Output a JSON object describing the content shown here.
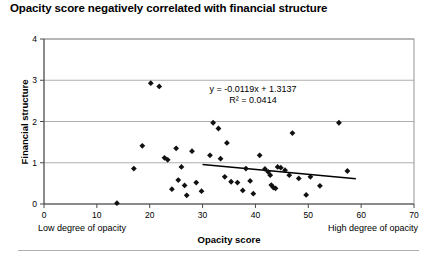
{
  "chart_data": {
    "type": "scatter",
    "title": "Opacity score negatively correlated with financial structure",
    "xlabel": "Opacity score",
    "ylabel": "Financial structure",
    "xlim": [
      0,
      70
    ],
    "ylim": [
      0,
      4
    ],
    "xticks": [
      0,
      10,
      20,
      30,
      40,
      50,
      60,
      70
    ],
    "yticks": [
      0,
      1,
      2,
      3,
      4
    ],
    "grid": "horizontal",
    "legend": "none",
    "annotations": {
      "equation": "y = -0.0119x + 1.3137",
      "r_squared": "R² = 0.0414",
      "x_axis_left_note": "Low degree of opacity",
      "x_axis_right_note": "High degree of opacity"
    },
    "trendline": {
      "slope": -0.0119,
      "intercept": 1.3137,
      "r2": 0.0414,
      "x_start": 30,
      "x_end": 59
    },
    "points": [
      [
        13.8,
        0.02
      ],
      [
        17.0,
        0.86
      ],
      [
        18.6,
        1.41
      ],
      [
        20.2,
        2.93
      ],
      [
        21.8,
        2.85
      ],
      [
        22.8,
        1.12
      ],
      [
        23.4,
        1.07
      ],
      [
        24.2,
        0.36
      ],
      [
        25.0,
        1.35
      ],
      [
        25.4,
        0.58
      ],
      [
        26.0,
        0.9
      ],
      [
        26.6,
        0.45
      ],
      [
        27.0,
        0.21
      ],
      [
        28.0,
        1.28
      ],
      [
        28.8,
        0.52
      ],
      [
        29.8,
        0.31
      ],
      [
        31.4,
        1.18
      ],
      [
        32.0,
        1.97
      ],
      [
        33.0,
        1.83
      ],
      [
        33.4,
        1.1
      ],
      [
        34.2,
        0.66
      ],
      [
        34.6,
        1.48
      ],
      [
        35.4,
        0.54
      ],
      [
        36.6,
        0.52
      ],
      [
        37.6,
        0.33
      ],
      [
        38.2,
        0.86
      ],
      [
        39.0,
        0.56
      ],
      [
        39.6,
        0.25
      ],
      [
        40.8,
        1.18
      ],
      [
        41.8,
        0.85
      ],
      [
        42.4,
        0.78
      ],
      [
        42.8,
        0.7
      ],
      [
        43.0,
        0.46
      ],
      [
        43.4,
        0.4
      ],
      [
        43.8,
        0.38
      ],
      [
        44.2,
        0.9
      ],
      [
        44.8,
        0.88
      ],
      [
        45.6,
        0.82
      ],
      [
        46.4,
        0.7
      ],
      [
        47.0,
        1.72
      ],
      [
        48.2,
        0.62
      ],
      [
        49.6,
        0.22
      ],
      [
        50.4,
        0.66
      ],
      [
        52.2,
        0.44
      ],
      [
        55.8,
        1.97
      ],
      [
        57.4,
        0.8
      ]
    ]
  }
}
